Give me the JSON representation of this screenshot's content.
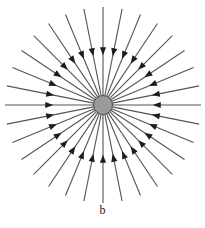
{
  "figure": {
    "caption": "b",
    "background_color": "#ffffff"
  },
  "charge": {
    "label": "negative-point-charge",
    "center_x": 103,
    "center_y": 105,
    "radius": 9.5,
    "fill_color": "#9a9a9a",
    "stroke_color": "#4a4a4a",
    "stroke_width": 1
  },
  "field": {
    "direction": "inward",
    "line_count": 32,
    "angle_step_deg": 11.25,
    "start_angle_deg": 0,
    "inner_radius": 9.5,
    "outer_radius": 98,
    "line_color": "#555555",
    "line_width": 1.1,
    "arrow": {
      "name": "field-arrowhead",
      "position_fraction": 0.5,
      "length": 8,
      "half_width": 3.1,
      "fill_color": "#1d1d1d"
    }
  },
  "chart_data": {
    "type": "scatter",
    "subtitle": "b",
    "xlabel": "",
    "ylabel": "",
    "grid": false,
    "legend": null,
    "annotations": [
      "b"
    ],
    "center": [
      103,
      105
    ],
    "charge_sign": "negative",
    "series": [
      {
        "name": "field-lines",
        "count": 32,
        "angles_deg": [
          0,
          11.25,
          22.5,
          33.75,
          45,
          56.25,
          67.5,
          78.75,
          90,
          101.25,
          112.5,
          123.75,
          135,
          146.25,
          157.5,
          168.75,
          180,
          191.25,
          202.5,
          213.75,
          225,
          236.25,
          247.5,
          258.75,
          270,
          281.25,
          292.5,
          303.75,
          315,
          326.25,
          337.5,
          348.75
        ],
        "inner_radius": 9.5,
        "outer_radius": 98,
        "arrow_direction": "toward-center",
        "arrow_radius": 54
      }
    ]
  }
}
